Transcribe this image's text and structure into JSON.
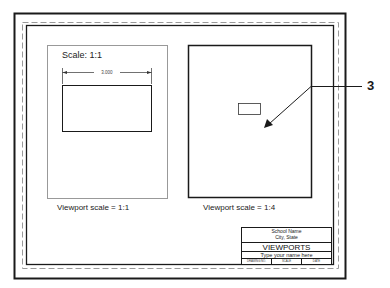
{
  "left_viewport": {
    "scale_label": "Scale: 1:1",
    "dimension_value": "3.000",
    "caption": "Viewport scale = 1:1"
  },
  "right_viewport": {
    "caption": "Viewport scale = 1:4"
  },
  "callout": {
    "number": "3"
  },
  "title_block": {
    "school_name": "School Name",
    "city_state": "City, State",
    "title": "VIEWPORTS",
    "name_field": "Type your name here",
    "cells": [
      "DRAWING NO.",
      "SCALE",
      "DATE"
    ]
  },
  "colors": {
    "line": "#1a1a1a",
    "thin_line": "#888888",
    "dashed": "#999999"
  }
}
